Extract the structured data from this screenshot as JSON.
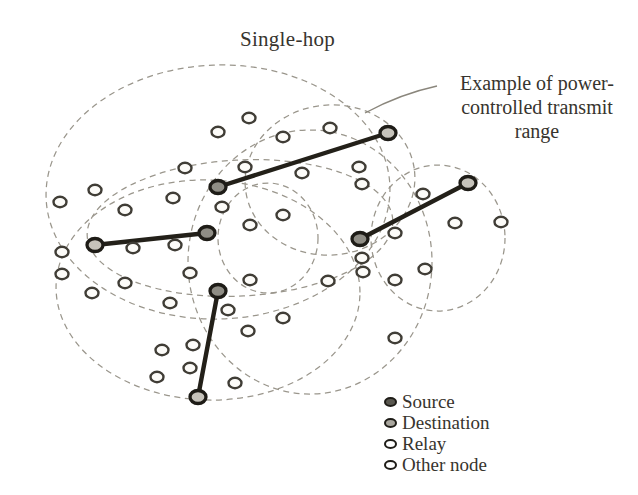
{
  "title": "Single-hop",
  "annotation": {
    "lines": [
      "Example of power-",
      "controlled transmit",
      "range"
    ]
  },
  "legend": {
    "items": [
      {
        "label": "Source",
        "type": "source",
        "fill": "#5a5850"
      },
      {
        "label": "Destination",
        "type": "destination",
        "fill": "#a9a69e"
      },
      {
        "label": "Relay",
        "type": "relay",
        "fill": "#ffffff"
      },
      {
        "label": "Other node",
        "type": "other",
        "fill": "#ffffff"
      }
    ]
  },
  "colors": {
    "background": "#ffffff",
    "ink": "#37342e",
    "node_outline": "#403d36",
    "node_fill": "#fcfbf8",
    "dash": "#9a968c",
    "link": "#232019",
    "ring": "#1e1c17",
    "source_fill": "#8f8d85",
    "dest_fill": "#c6c3bb"
  },
  "diagram": {
    "ranges": [
      {
        "cx": 218,
        "cy": 192,
        "rx": 172,
        "ry": 127,
        "rot": -2
      },
      {
        "cx": 330,
        "cy": 180,
        "rx": 85,
        "ry": 75,
        "rot": -6
      },
      {
        "cx": 240,
        "cy": 228,
        "rx": 153,
        "ry": 68,
        "rot": -3
      },
      {
        "cx": 268,
        "cy": 238,
        "rx": 50,
        "ry": 55,
        "rot": 0
      },
      {
        "cx": 438,
        "cy": 238,
        "rx": 67,
        "ry": 73,
        "rot": 0
      },
      {
        "cx": 208,
        "cy": 290,
        "rx": 152,
        "ry": 110,
        "rot": 2
      },
      {
        "cx": 310,
        "cy": 262,
        "rx": 122,
        "ry": 132,
        "rot": 0
      }
    ],
    "links": [
      {
        "source": [
          218,
          187
        ],
        "destination": [
          388,
          133
        ]
      },
      {
        "source": [
          360,
          239
        ],
        "destination": [
          468,
          183
        ]
      },
      {
        "source": [
          207,
          233
        ],
        "destination": [
          95,
          245
        ]
      },
      {
        "source": [
          218,
          291
        ],
        "destination": [
          198,
          397
        ]
      }
    ],
    "nodes": [
      [
        218,
        132
      ],
      [
        249,
        118
      ],
      [
        283,
        137
      ],
      [
        330,
        128
      ],
      [
        60,
        202
      ],
      [
        95,
        190
      ],
      [
        125,
        210
      ],
      [
        173,
        198
      ],
      [
        185,
        168
      ],
      [
        245,
        167
      ],
      [
        302,
        173
      ],
      [
        222,
        207
      ],
      [
        250,
        225
      ],
      [
        283,
        215
      ],
      [
        62,
        252
      ],
      [
        133,
        248
      ],
      [
        175,
        245
      ],
      [
        359,
        167
      ],
      [
        362,
        184
      ],
      [
        423,
        194
      ],
      [
        455,
        223
      ],
      [
        501,
        222
      ],
      [
        395,
        233
      ],
      [
        62,
        274
      ],
      [
        92,
        293
      ],
      [
        125,
        283
      ],
      [
        190,
        273
      ],
      [
        170,
        303
      ],
      [
        228,
        310
      ],
      [
        250,
        280
      ],
      [
        248,
        331
      ],
      [
        283,
        318
      ],
      [
        162,
        350
      ],
      [
        193,
        345
      ],
      [
        190,
        368
      ],
      [
        157,
        377
      ],
      [
        235,
        383
      ],
      [
        328,
        281
      ],
      [
        362,
        258
      ],
      [
        363,
        272
      ],
      [
        395,
        280
      ],
      [
        425,
        269
      ],
      [
        395,
        338
      ]
    ],
    "leader": {
      "path": "M 365 113 Q 400 94 437 86"
    }
  }
}
